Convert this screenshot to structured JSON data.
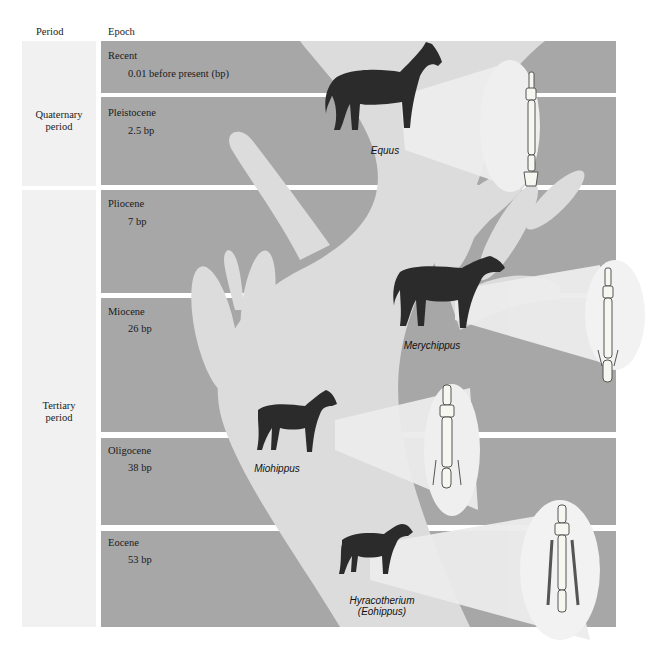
{
  "headers": {
    "period": "Period",
    "epoch": "Epoch"
  },
  "periods": [
    {
      "line1": "Quaternary",
      "line2": "period"
    },
    {
      "line1": "Tertiary",
      "line2": "period"
    }
  ],
  "epochs": [
    {
      "name": "Recent",
      "date": "0.01 before present (bp)"
    },
    {
      "name": "Pleistocene",
      "date": "2.5 bp"
    },
    {
      "name": "Pliocene",
      "date": "7 bp"
    },
    {
      "name": "Miocene",
      "date": "26 bp"
    },
    {
      "name": "Oligocene",
      "date": "38 bp"
    },
    {
      "name": "Eocene",
      "date": "53 bp"
    }
  ],
  "genera": [
    {
      "name": "Equus",
      "icon": "horse-icon"
    },
    {
      "name": "Merychippus",
      "icon": "horse-icon"
    },
    {
      "name": "Miohippus",
      "icon": "horse-icon"
    },
    {
      "name": "Hyracotherium",
      "alt": "(Eohippus)",
      "icon": "horse-icon"
    }
  ],
  "colors": {
    "band": "#a7a7a7",
    "tree": "#dcdcdc",
    "spotlight": "#ececec",
    "period_panel": "#f1f1f1",
    "horse": "#2b2b2b",
    "bone": "#f7f7f2"
  }
}
